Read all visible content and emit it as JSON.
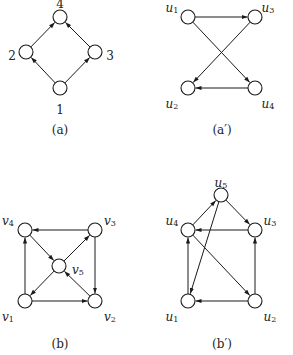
{
  "graphs": [
    {
      "id": "a",
      "caption": "(a)",
      "caption_pos": [
        60,
        130
      ],
      "nodes": [
        {
          "id": "1",
          "label": "1",
          "x": 60,
          "y": 88,
          "lx": 60,
          "ly": 110,
          "italic": false
        },
        {
          "id": "2",
          "label": "2",
          "x": 26,
          "y": 52,
          "lx": 12,
          "ly": 56,
          "italic": false
        },
        {
          "id": "3",
          "label": "3",
          "x": 95,
          "y": 52,
          "lx": 110,
          "ly": 56,
          "italic": false
        },
        {
          "id": "4",
          "label": "4",
          "x": 60,
          "y": 17,
          "lx": 60,
          "ly": 4,
          "italic": false
        }
      ],
      "edges": [
        [
          "1",
          "2"
        ],
        [
          "1",
          "3"
        ],
        [
          "2",
          "4"
        ],
        [
          "3",
          "4"
        ]
      ]
    },
    {
      "id": "a-prime",
      "caption": "(a′)",
      "caption_pos": [
        222,
        130
      ],
      "nodes": [
        {
          "id": "u1",
          "label": "u",
          "sub": "1",
          "x": 188,
          "y": 17,
          "lx": 172,
          "ly": 8,
          "italic": true
        },
        {
          "id": "u3",
          "label": "u",
          "sub": "3",
          "x": 255,
          "y": 17,
          "lx": 268,
          "ly": 8,
          "italic": true
        },
        {
          "id": "u2",
          "label": "u",
          "sub": "2",
          "x": 188,
          "y": 88,
          "lx": 172,
          "ly": 104,
          "italic": true
        },
        {
          "id": "u4",
          "label": "u",
          "sub": "4",
          "x": 255,
          "y": 88,
          "lx": 268,
          "ly": 104,
          "italic": true
        }
      ],
      "edges": [
        [
          "u1",
          "u3"
        ],
        [
          "u1",
          "u4"
        ],
        [
          "u3",
          "u2"
        ],
        [
          "u4",
          "u2"
        ]
      ]
    },
    {
      "id": "b",
      "caption": "(b)",
      "caption_pos": [
        60,
        344
      ],
      "nodes": [
        {
          "id": "v1",
          "label": "v",
          "sub": "1",
          "x": 25,
          "y": 301,
          "lx": 8,
          "ly": 317,
          "italic": true
        },
        {
          "id": "v2",
          "label": "v",
          "sub": "2",
          "x": 95,
          "y": 301,
          "lx": 110,
          "ly": 317,
          "italic": true
        },
        {
          "id": "v3",
          "label": "v",
          "sub": "3",
          "x": 95,
          "y": 230,
          "lx": 110,
          "ly": 221,
          "italic": true
        },
        {
          "id": "v4",
          "label": "v",
          "sub": "4",
          "x": 25,
          "y": 230,
          "lx": 8,
          "ly": 221,
          "italic": true
        },
        {
          "id": "v5",
          "label": "v",
          "sub": "5",
          "x": 59,
          "y": 266,
          "lx": 78,
          "ly": 270,
          "italic": true
        }
      ],
      "edges": [
        [
          "v1",
          "v4"
        ],
        [
          "v1",
          "v2"
        ],
        [
          "v3",
          "v4"
        ],
        [
          "v3",
          "v2"
        ],
        [
          "v4",
          "v5"
        ],
        [
          "v5",
          "v3"
        ],
        [
          "v5",
          "v1"
        ],
        [
          "v2",
          "v5"
        ]
      ]
    },
    {
      "id": "b-prime",
      "caption": "(b′)",
      "caption_pos": [
        222,
        344
      ],
      "nodes": [
        {
          "id": "u1",
          "label": "u",
          "sub": "1",
          "x": 188,
          "y": 301,
          "lx": 172,
          "ly": 317,
          "italic": true
        },
        {
          "id": "u2",
          "label": "u",
          "sub": "2",
          "x": 255,
          "y": 301,
          "lx": 270,
          "ly": 317,
          "italic": true
        },
        {
          "id": "u3",
          "label": "u",
          "sub": "3",
          "x": 255,
          "y": 230,
          "lx": 270,
          "ly": 221,
          "italic": true
        },
        {
          "id": "u4",
          "label": "u",
          "sub": "4",
          "x": 188,
          "y": 230,
          "lx": 172,
          "ly": 221,
          "italic": true
        },
        {
          "id": "u5",
          "label": "u",
          "sub": "5",
          "x": 221,
          "y": 195,
          "lx": 221,
          "ly": 183,
          "italic": true
        }
      ],
      "edges": [
        [
          "u1",
          "u4"
        ],
        [
          "u2",
          "u1"
        ],
        [
          "u2",
          "u3"
        ],
        [
          "u3",
          "u4"
        ],
        [
          "u4",
          "u5"
        ],
        [
          "u5",
          "u3"
        ],
        [
          "u5",
          "u1"
        ],
        [
          "u4",
          "u2"
        ]
      ]
    }
  ],
  "style": {
    "node_radius": 7,
    "stroke": "#1a1a1a",
    "background": "#ffffff"
  }
}
